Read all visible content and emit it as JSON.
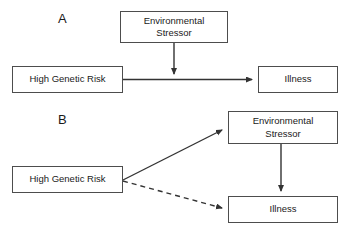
{
  "figure": {
    "width": 349,
    "height": 238,
    "background": "#ffffff",
    "line_color": "#333333",
    "box_border_color": "#4d4d4d",
    "text_color": "#1a1a1a"
  },
  "panels": [
    {
      "id": "A",
      "label": "A",
      "label_x": 58,
      "label_y": 12,
      "nodes": [
        {
          "id": "a-environmental-stressor",
          "name": "environmental-stressor-box",
          "label": "Environmental\nStressor",
          "x": 120,
          "y": 11,
          "width": 108,
          "height": 32
        },
        {
          "id": "a-high-genetic-risk",
          "name": "high-genetic-risk-box",
          "label": "High Genetic Risk",
          "x": 12,
          "y": 66,
          "width": 111,
          "height": 27
        },
        {
          "id": "a-illness",
          "name": "illness-box",
          "label": "Illness",
          "x": 258,
          "y": 66,
          "width": 80,
          "height": 27
        }
      ],
      "edges": [
        {
          "id": "a-edge-genetic-to-illness",
          "name": "arrow-high-genetic-risk-to-illness",
          "style": "solid",
          "from": "a-high-genetic-risk",
          "to": "a-illness",
          "arrowhead": "end"
        },
        {
          "id": "a-edge-stressor-to-path",
          "name": "arrow-environmental-stressor-to-pathway",
          "style": "solid",
          "from": "a-environmental-stressor",
          "to": "a-edge-genetic-to-illness",
          "arrowhead": "end"
        }
      ]
    },
    {
      "id": "B",
      "label": "B",
      "label_x": 58,
      "label_y": 113,
      "nodes": [
        {
          "id": "b-environmental-stressor",
          "name": "environmental-stressor-box",
          "label": "Environmental\nStressor",
          "x": 228,
          "y": 111,
          "width": 110,
          "height": 33
        },
        {
          "id": "b-high-genetic-risk",
          "name": "high-genetic-risk-box",
          "label": "High Genetic Risk",
          "x": 12,
          "y": 166,
          "width": 111,
          "height": 27
        },
        {
          "id": "b-illness",
          "name": "illness-box",
          "label": "Illness",
          "x": 228,
          "y": 196,
          "width": 110,
          "height": 27
        }
      ],
      "edges": [
        {
          "id": "b-edge-genetic-to-stressor",
          "name": "arrow-high-genetic-risk-to-environmental-stressor",
          "style": "solid",
          "from": "b-high-genetic-risk",
          "to": "b-environmental-stressor",
          "arrowhead": "end"
        },
        {
          "id": "b-edge-genetic-to-illness",
          "name": "dashed-arrow-high-genetic-risk-to-illness",
          "style": "dashed",
          "from": "b-high-genetic-risk",
          "to": "b-illness",
          "arrowhead": "end"
        },
        {
          "id": "b-edge-stressor-to-illness",
          "name": "arrow-environmental-stressor-to-illness",
          "style": "solid",
          "from": "b-environmental-stressor",
          "to": "b-illness",
          "arrowhead": "end"
        }
      ]
    }
  ]
}
